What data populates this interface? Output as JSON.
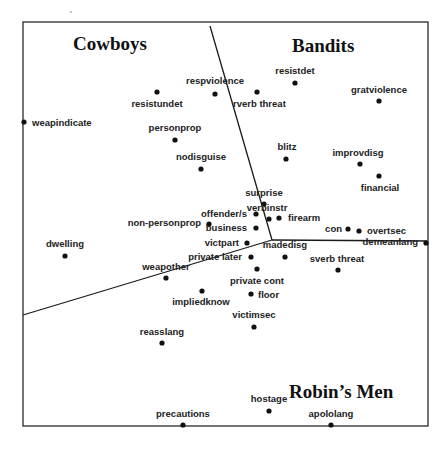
{
  "regions": [
    {
      "id": "cowboys",
      "label": "Cowboys",
      "x": 73,
      "y": 50
    },
    {
      "id": "bandits",
      "label": "Bandits",
      "x": 292,
      "y": 52
    },
    {
      "id": "robins-men",
      "label": "Robin’s Men",
      "x": 289,
      "y": 398
    }
  ],
  "frame": {
    "x1": 23,
    "y1": 22,
    "x2": 428,
    "y2": 426
  },
  "dividers": [
    {
      "name": "cowboys-bandits-divider",
      "points": "210,26 272,240"
    },
    {
      "name": "bandits-robinsmen-divider",
      "points": "272,240 427,241"
    },
    {
      "name": "cowboys-robinsmen-divider",
      "points": "23,315 272,240"
    }
  ],
  "points": [
    {
      "name": "resistundet",
      "label": "resistundet",
      "px": 157,
      "py": 92,
      "lx": 157,
      "ly": 107,
      "anchor": "middle"
    },
    {
      "name": "respviolence",
      "label": "respviolence",
      "px": 215,
      "py": 94,
      "lx": 215,
      "ly": 84,
      "anchor": "middle"
    },
    {
      "name": "rverb-threat",
      "label": "rverb threat",
      "px": 257,
      "py": 92,
      "lx": 233,
      "ly": 107,
      "anchor": "start"
    },
    {
      "name": "resistdet",
      "label": "resistdet",
      "px": 295,
      "py": 83,
      "lx": 295,
      "ly": 74,
      "anchor": "middle"
    },
    {
      "name": "gratviolence",
      "label": "gratviolence",
      "px": 379,
      "py": 101,
      "lx": 379,
      "ly": 93,
      "anchor": "middle"
    },
    {
      "name": "weapindicate",
      "label": "weapindicate",
      "px": 24,
      "py": 122,
      "lx": 32,
      "ly": 126,
      "anchor": "start"
    },
    {
      "name": "personprop",
      "label": "personprop",
      "px": 175,
      "py": 140,
      "lx": 175,
      "ly": 131,
      "anchor": "middle"
    },
    {
      "name": "nodisguise",
      "label": "nodisguise",
      "px": 201,
      "py": 169,
      "lx": 201,
      "ly": 160,
      "anchor": "middle"
    },
    {
      "name": "blitz",
      "label": "blitz",
      "px": 286,
      "py": 159,
      "lx": 287,
      "ly": 150,
      "anchor": "middle"
    },
    {
      "name": "improvdisg",
      "label": "improvdisg",
      "px": 360,
      "py": 164,
      "lx": 358,
      "ly": 156,
      "anchor": "middle"
    },
    {
      "name": "financial",
      "label": "financial",
      "px": 379,
      "py": 176,
      "lx": 380,
      "ly": 191,
      "anchor": "middle"
    },
    {
      "name": "surprise",
      "label": "surprise",
      "px": 264,
      "py": 204,
      "lx": 264,
      "ly": 196,
      "anchor": "middle"
    },
    {
      "name": "verbinstr",
      "label": "verbinstr",
      "px": 269,
      "py": 219,
      "lx": 267,
      "ly": 211,
      "anchor": "middle"
    },
    {
      "name": "offender-s",
      "label": "offender/s",
      "px": 256,
      "py": 214,
      "lx": 247,
      "ly": 217,
      "anchor": "end"
    },
    {
      "name": "firearm",
      "label": "firearm",
      "px": 279,
      "py": 218,
      "lx": 288,
      "ly": 221,
      "anchor": "start"
    },
    {
      "name": "non-personprop",
      "label": "non-personprop",
      "px": 209,
      "py": 224,
      "lx": 201,
      "ly": 226,
      "anchor": "end"
    },
    {
      "name": "business",
      "label": "business",
      "px": 256,
      "py": 228,
      "lx": 247,
      "ly": 231,
      "anchor": "end"
    },
    {
      "name": "con",
      "label": "con",
      "px": 348,
      "py": 229,
      "lx": 342,
      "ly": 232,
      "anchor": "end"
    },
    {
      "name": "overtsec",
      "label": "overtsec",
      "px": 359,
      "py": 231,
      "lx": 367,
      "ly": 234,
      "anchor": "start"
    },
    {
      "name": "demeanlang",
      "label": "demeanlang",
      "px": 426,
      "py": 243,
      "lx": 418,
      "ly": 245,
      "anchor": "end"
    },
    {
      "name": "dwelling",
      "label": "dwelling",
      "px": 65,
      "py": 256,
      "lx": 65,
      "ly": 247,
      "anchor": "middle"
    },
    {
      "name": "victpart",
      "label": "victpart",
      "px": 247,
      "py": 243,
      "lx": 239,
      "ly": 246,
      "anchor": "end"
    },
    {
      "name": "private-later",
      "label": "private later",
      "px": 251,
      "py": 257,
      "lx": 242,
      "ly": 260,
      "anchor": "end"
    },
    {
      "name": "madedisg",
      "label": "madedisg",
      "px": 285,
      "py": 257,
      "lx": 285,
      "ly": 248,
      "anchor": "middle"
    },
    {
      "name": "sverb-threat",
      "label": "sverb threat",
      "px": 338,
      "py": 270,
      "lx": 337,
      "ly": 262,
      "anchor": "middle"
    },
    {
      "name": "weapother",
      "label": "weapother",
      "px": 166,
      "py": 278,
      "lx": 166,
      "ly": 270,
      "anchor": "middle"
    },
    {
      "name": "private-cont",
      "label": "private cont",
      "px": 257,
      "py": 269,
      "lx": 257,
      "ly": 284,
      "anchor": "middle"
    },
    {
      "name": "impliedknow",
      "label": "impliedknow",
      "px": 202,
      "py": 291,
      "lx": 201,
      "ly": 305,
      "anchor": "middle"
    },
    {
      "name": "floor",
      "label": "floor",
      "px": 251,
      "py": 294,
      "lx": 258,
      "ly": 298,
      "anchor": "start"
    },
    {
      "name": "victimsec",
      "label": "victimsec",
      "px": 254,
      "py": 327,
      "lx": 254,
      "ly": 318,
      "anchor": "middle"
    },
    {
      "name": "reasslang",
      "label": "reasslang",
      "px": 162,
      "py": 343,
      "lx": 162,
      "ly": 335,
      "anchor": "middle"
    },
    {
      "name": "hostage",
      "label": "hostage",
      "px": 269,
      "py": 411,
      "lx": 269,
      "ly": 402,
      "anchor": "middle"
    },
    {
      "name": "precautions",
      "label": "precautions",
      "px": 183,
      "py": 425,
      "lx": 183,
      "ly": 417,
      "anchor": "middle"
    },
    {
      "name": "apololang",
      "label": "apololang",
      "px": 331,
      "py": 425,
      "lx": 331,
      "ly": 417,
      "anchor": "middle"
    }
  ]
}
